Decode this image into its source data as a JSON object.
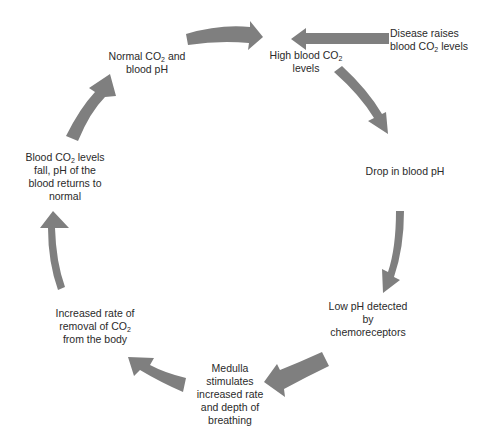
{
  "diagram": {
    "type": "cycle",
    "arrow_color": "#7f7f7f",
    "nodes": [
      {
        "id": "normal",
        "pre": "Normal CO",
        "sub": "2",
        "post": " and",
        "line2": "blood pH"
      },
      {
        "id": "high",
        "pre": "High blood CO",
        "sub": "2",
        "post": "",
        "line2": "levels"
      },
      {
        "id": "disease",
        "line1": "Disease raises",
        "pre": "blood CO",
        "sub": "2",
        "post": " levels"
      },
      {
        "id": "drop",
        "line1": "Drop in blood pH"
      },
      {
        "id": "detect",
        "line1": "Low pH detected",
        "line2": "by",
        "line3": "chemoreceptors"
      },
      {
        "id": "medulla",
        "line1": "Medulla",
        "line2": "stimulates",
        "line3": "increased rate",
        "line4": "and depth of",
        "line5": "breathing"
      },
      {
        "id": "removal",
        "line1": "Increased rate of",
        "pre": "removal of CO",
        "sub": "2",
        "line3": "from the body"
      },
      {
        "id": "fall",
        "pre": "Blood CO",
        "sub": "2",
        "post": " levels",
        "line2": "fall, pH of the",
        "line3": "blood returns to",
        "line4": "normal"
      }
    ],
    "edges": [
      [
        "normal",
        "high"
      ],
      [
        "disease",
        "high"
      ],
      [
        "high",
        "drop"
      ],
      [
        "drop",
        "detect"
      ],
      [
        "detect",
        "medulla"
      ],
      [
        "medulla",
        "removal"
      ],
      [
        "removal",
        "fall"
      ],
      [
        "fall",
        "normal"
      ]
    ]
  }
}
